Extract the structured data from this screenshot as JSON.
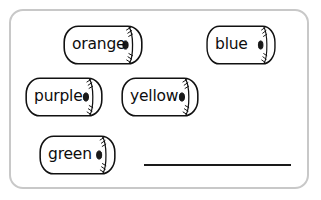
{
  "worksheet": {
    "card": {
      "border_color": "#c8c8c8",
      "background_color": "#ffffff"
    },
    "chips": [
      {
        "id": "orange",
        "label": "orange",
        "icon": "paper-roll-icon",
        "x": 52,
        "y": 14,
        "width": 80,
        "height": 40
      },
      {
        "id": "blue",
        "label": "blue",
        "icon": "paper-roll-icon",
        "x": 195,
        "y": 14,
        "width": 70,
        "height": 40
      },
      {
        "id": "purple",
        "label": "purple",
        "icon": "paper-roll-icon",
        "x": 14,
        "y": 66,
        "width": 78,
        "height": 40
      },
      {
        "id": "yellow",
        "label": "yellow",
        "icon": "paper-roll-icon",
        "x": 110,
        "y": 66,
        "width": 78,
        "height": 40
      },
      {
        "id": "green",
        "label": "green",
        "icon": "paper-roll-icon",
        "x": 28,
        "y": 124,
        "width": 77,
        "height": 40
      }
    ],
    "answer_blank": {
      "label": "",
      "color": "#1a1a1a"
    }
  }
}
